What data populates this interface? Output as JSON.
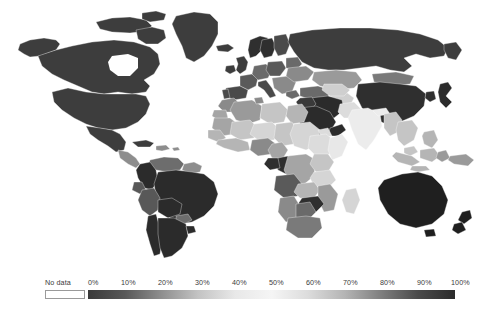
{
  "legend": {
    "no_data_label": "No data",
    "tick_labels": [
      "0%",
      "10%",
      "20%",
      "30%",
      "40%",
      "50%",
      "60%",
      "70%",
      "80%",
      "90%",
      "100%"
    ],
    "no_data_color": "#ffffff",
    "band_colors": [
      "#3a3a3a",
      "#585858",
      "#8e8e8e",
      "#c3c3c3",
      "#e8e8e8",
      "#f5f5f5",
      "#dcdcdc",
      "#b4b4b4",
      "#7d7d7d",
      "#4a4a4a",
      "#2b2b2b"
    ]
  },
  "chart_data": {
    "type": "heatmap",
    "title": "",
    "xlabel": "",
    "ylabel": "",
    "legend_position": "bottom",
    "grid": false,
    "scale_min": 0,
    "scale_max": 100,
    "scale_unit": "%",
    "no_data_color": "#ffffff",
    "color_scale": [
      {
        "stop": 0,
        "color": "#3a3a3a"
      },
      {
        "stop": 10,
        "color": "#585858"
      },
      {
        "stop": 20,
        "color": "#8e8e8e"
      },
      {
        "stop": 30,
        "color": "#c3c3c3"
      },
      {
        "stop": 40,
        "color": "#e8e8e8"
      },
      {
        "stop": 50,
        "color": "#f5f5f5"
      },
      {
        "stop": 60,
        "color": "#dcdcdc"
      },
      {
        "stop": 70,
        "color": "#b4b4b4"
      },
      {
        "stop": 80,
        "color": "#7d7d7d"
      },
      {
        "stop": 90,
        "color": "#4a4a4a"
      },
      {
        "stop": 100,
        "color": "#2b2b2b"
      }
    ],
    "regions": [
      {
        "name": "Canada",
        "color": "#3d3d3d"
      },
      {
        "name": "United States",
        "color": "#3d3d3d"
      },
      {
        "name": "Alaska",
        "color": "#3d3d3d"
      },
      {
        "name": "Greenland",
        "color": "#3d3d3d"
      },
      {
        "name": "Mexico",
        "color": "#3d3d3d"
      },
      {
        "name": "Central America",
        "color": "#8d8d8d"
      },
      {
        "name": "Caribbean",
        "color": "#8d8d8d"
      },
      {
        "name": "Cuba",
        "color": "#3d3d3d"
      },
      {
        "name": "Colombia",
        "color": "#2b2b2b"
      },
      {
        "name": "Venezuela",
        "color": "#6d6d6d"
      },
      {
        "name": "Guyanas",
        "color": "#8d8d8d"
      },
      {
        "name": "Brazil",
        "color": "#2b2b2b"
      },
      {
        "name": "Peru",
        "color": "#585858"
      },
      {
        "name": "Bolivia",
        "color": "#2b2b2b"
      },
      {
        "name": "Chile",
        "color": "#2b2b2b"
      },
      {
        "name": "Argentina",
        "color": "#2b2b2b"
      },
      {
        "name": "Paraguay",
        "color": "#6d6d6d"
      },
      {
        "name": "Uruguay",
        "color": "#2b2b2b"
      },
      {
        "name": "Ecuador",
        "color": "#585858"
      },
      {
        "name": "United Kingdom",
        "color": "#3d3d3d"
      },
      {
        "name": "Ireland",
        "color": "#3d3d3d"
      },
      {
        "name": "France",
        "color": "#5a5a5a"
      },
      {
        "name": "Spain",
        "color": "#4a4a4a"
      },
      {
        "name": "Portugal",
        "color": "#4a4a4a"
      },
      {
        "name": "Norway",
        "color": "#2f2f2f"
      },
      {
        "name": "Sweden",
        "color": "#2f2f2f"
      },
      {
        "name": "Finland",
        "color": "#4a4a4a"
      },
      {
        "name": "Germany",
        "color": "#6a6a6a"
      },
      {
        "name": "Poland",
        "color": "#5a5a5a"
      },
      {
        "name": "Italy",
        "color": "#4a4a4a"
      },
      {
        "name": "Balkans",
        "color": "#8a8a8a"
      },
      {
        "name": "Ukraine",
        "color": "#8a8a8a"
      },
      {
        "name": "Belarus",
        "color": "#6a6a6a"
      },
      {
        "name": "Turkey",
        "color": "#6a6a6a"
      },
      {
        "name": "Russia",
        "color": "#3d3d3d"
      },
      {
        "name": "Kazakhstan",
        "color": "#9a9a9a"
      },
      {
        "name": "Mongolia",
        "color": "#7a7a7a"
      },
      {
        "name": "China",
        "color": "#2f2f2f"
      },
      {
        "name": "Japan",
        "color": "#2b2b2b"
      },
      {
        "name": "Koreas",
        "color": "#2f2f2f"
      },
      {
        "name": "India",
        "color": "#ececec"
      },
      {
        "name": "Pakistan",
        "color": "#dcdcdc"
      },
      {
        "name": "Afghanistan",
        "color": "#cfcfcf"
      },
      {
        "name": "Iran",
        "color": "#2b2b2b"
      },
      {
        "name": "Iraq",
        "color": "#3a3a3a"
      },
      {
        "name": "Saudi Arabia",
        "color": "#2b2b2b"
      },
      {
        "name": "Central Asia",
        "color": "#cfcfcf"
      },
      {
        "name": "Southeast Asia",
        "color": "#c5c5c5"
      },
      {
        "name": "Indonesia",
        "color": "#b5b5b5"
      },
      {
        "name": "Philippines",
        "color": "#b5b5b5"
      },
      {
        "name": "Papua New Guinea",
        "color": "#9a9a9a"
      },
      {
        "name": "Australia",
        "color": "#1f1f1f"
      },
      {
        "name": "New Zealand",
        "color": "#1f1f1f"
      },
      {
        "name": "Morocco",
        "color": "#8a8a8a"
      },
      {
        "name": "Algeria",
        "color": "#9a9a9a"
      },
      {
        "name": "Libya",
        "color": "#c5c5c5"
      },
      {
        "name": "Egypt",
        "color": "#b5b5b5"
      },
      {
        "name": "Sudan",
        "color": "#d5d5d5"
      },
      {
        "name": "Mauritania",
        "color": "#a5a5a5"
      },
      {
        "name": "Mali",
        "color": "#c5c5c5"
      },
      {
        "name": "Niger",
        "color": "#d5d5d5"
      },
      {
        "name": "Chad",
        "color": "#c5c5c5"
      },
      {
        "name": "Nigeria",
        "color": "#8a8a8a"
      },
      {
        "name": "Ethiopia",
        "color": "#dcdcdc"
      },
      {
        "name": "Somalia",
        "color": "#e8e8e8"
      },
      {
        "name": "Kenya",
        "color": "#c5c5c5"
      },
      {
        "name": "Tanzania",
        "color": "#d5d5d5"
      },
      {
        "name": "DR Congo",
        "color": "#a5a5a5"
      },
      {
        "name": "Congo",
        "color": "#2f2f2f"
      },
      {
        "name": "Gabon",
        "color": "#2f2f2f"
      },
      {
        "name": "Angola",
        "color": "#5a5a5a"
      },
      {
        "name": "Zambia",
        "color": "#b5b5b5"
      },
      {
        "name": "Zimbabwe",
        "color": "#2f2f2f"
      },
      {
        "name": "Mozambique",
        "color": "#9a9a9a"
      },
      {
        "name": "Madagascar",
        "color": "#d5d5d5"
      },
      {
        "name": "South Africa",
        "color": "#7a7a7a"
      },
      {
        "name": "Namibia",
        "color": "#8a8a8a"
      },
      {
        "name": "Botswana",
        "color": "#6a6a6a"
      },
      {
        "name": "West Africa Coast",
        "color": "#b5b5b5"
      }
    ]
  }
}
